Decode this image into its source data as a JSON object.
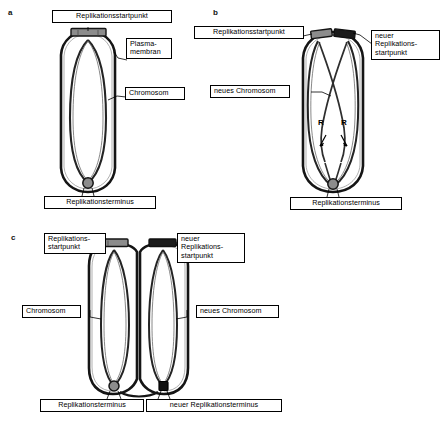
{
  "figure": {
    "title_visible": false,
    "background": "#ffffff",
    "panels": [
      {
        "id": "a",
        "letter": "a",
        "description": "Bakterienzelle mit einem Chromosom vor der Replikation",
        "labels": [
          {
            "name": "replication-origin",
            "text": "Replikationsstartpunkt",
            "lines": [
              "Replikationsstartpunkt"
            ]
          },
          {
            "name": "plasma-membrane",
            "text": "Plasma-\nmembran",
            "lines": [
              "Plasma-",
              "membran"
            ]
          },
          {
            "name": "chromosome",
            "text": "Chromosom",
            "lines": [
              "Chromosom"
            ]
          },
          {
            "name": "replication-terminus",
            "text": "Replikationsterminus",
            "lines": [
              "Replikationsterminus"
            ]
          }
        ]
      },
      {
        "id": "b",
        "letter": "b",
        "description": "Zelle waehrend der Replikation mit zwei Replikationsgabeln",
        "labels": [
          {
            "name": "replication-origin",
            "text": "Replikationsstartpunkt",
            "lines": [
              "Replikationsstartpunkt"
            ]
          },
          {
            "name": "new-replication-origin",
            "text": "neuer\nReplikations-\nstartpunkt",
            "lines": [
              "neuer",
              "Replikations-",
              "startpunkt"
            ]
          },
          {
            "name": "new-chromosome",
            "text": "neues Chromosom",
            "lines": [
              "neues Chromosom"
            ]
          },
          {
            "name": "replication-terminus",
            "text": "Replikationsterminus",
            "lines": [
              "Replikationsterminus"
            ]
          }
        ],
        "fork_markers": [
          {
            "name": "replication-fork-left",
            "text": "R"
          },
          {
            "name": "replication-fork-right",
            "text": "R"
          }
        ]
      },
      {
        "id": "c",
        "letter": "c",
        "description": "Zellteilung: zwei Tochterzellen mit je einem Chromosom",
        "labels": [
          {
            "name": "replication-origin",
            "text": "Replikations-\nstartpunkt",
            "lines": [
              "Replikations-",
              "startpunkt"
            ]
          },
          {
            "name": "new-replication-origin",
            "text": "neuer\nReplikations-\nstartpunkt",
            "lines": [
              "neuer",
              "Replikations-",
              "startpunkt"
            ]
          },
          {
            "name": "chromosome",
            "text": "Chromosom",
            "lines": [
              "Chromosom"
            ]
          },
          {
            "name": "new-chromosome",
            "text": "neues Chromosom",
            "lines": [
              "neues Chromosom"
            ]
          },
          {
            "name": "replication-terminus",
            "text": "Replikationsterminus",
            "lines": [
              "Replikationsterminus"
            ]
          },
          {
            "name": "new-replication-terminus",
            "text": "neuer Replikationsterminus",
            "lines": [
              "neuer Replikationsterminus"
            ]
          }
        ]
      }
    ],
    "colors": {
      "outline": "#111111",
      "membrane": "#1a1a1a",
      "dna_old": "#2b2b2b",
      "dna_new": "#3a3a3a",
      "origin_old_fill": "#8c8c8c",
      "origin_new_fill": "#1b1b1b",
      "terminus_old_fill": "#8c8c8c",
      "terminus_new_fill": "#111111",
      "label_background": "#ffffff",
      "label_border": "#000000",
      "text": "#000000"
    }
  }
}
